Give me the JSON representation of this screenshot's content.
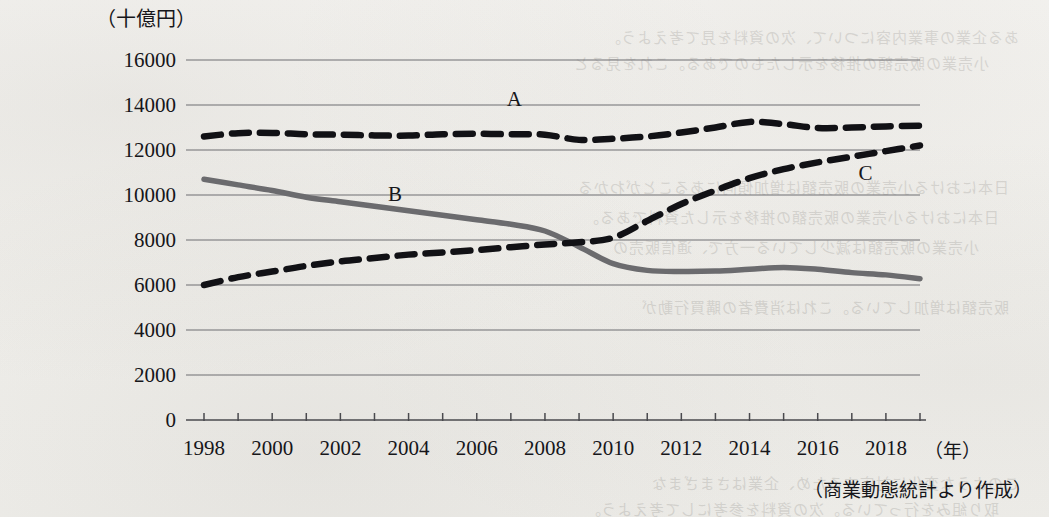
{
  "chart_data": {
    "type": "line",
    "title": "",
    "ylabel": "（十億円）",
    "xlabel": "（年）",
    "source_note": "（商業動態統計より作成）",
    "grid": true,
    "legend_position": "inline-labels",
    "ylim": [
      0,
      16000
    ],
    "ytick_step": 2000,
    "ytick_labels": [
      "16000",
      "14000",
      "12000",
      "10000",
      "8000",
      "6000",
      "4000",
      "2000",
      "0"
    ],
    "ytick_values": [
      16000,
      14000,
      12000,
      10000,
      8000,
      6000,
      4000,
      2000,
      0
    ],
    "xlim": [
      1998,
      2019
    ],
    "xtick_labels": [
      "1998",
      "2000",
      "2002",
      "2004",
      "2006",
      "2008",
      "2010",
      "2012",
      "2014",
      "2016",
      "2018"
    ],
    "xtick_values": [
      1998,
      2000,
      2002,
      2004,
      2006,
      2008,
      2010,
      2012,
      2014,
      2016,
      2018
    ],
    "x": [
      1998,
      1999,
      2000,
      2001,
      2002,
      2003,
      2004,
      2005,
      2006,
      2007,
      2008,
      2009,
      2010,
      2011,
      2012,
      2013,
      2014,
      2015,
      2016,
      2017,
      2018,
      2019
    ],
    "series": [
      {
        "name": "A",
        "label": "A",
        "style": "dashed",
        "color": "#111115",
        "label_x": 2007.1,
        "label_y": 13950,
        "values": [
          12600,
          12750,
          12760,
          12700,
          12680,
          12650,
          12640,
          12700,
          12720,
          12700,
          12680,
          12450,
          12500,
          12600,
          12780,
          13000,
          13250,
          13150,
          12980,
          13000,
          13050,
          13080
        ]
      },
      {
        "name": "B",
        "label": "B",
        "style": "solid",
        "color": "#6b6b6e",
        "label_x": 2003.6,
        "label_y": 9750,
        "values": [
          10700,
          10450,
          10200,
          9900,
          9700,
          9500,
          9300,
          9100,
          8900,
          8700,
          8400,
          7700,
          6950,
          6650,
          6600,
          6620,
          6700,
          6780,
          6700,
          6550,
          6450,
          6280
        ]
      },
      {
        "name": "C",
        "label": "C",
        "style": "dashed",
        "color": "#111115",
        "label_x": 2017.4,
        "label_y": 10650,
        "values": [
          6000,
          6350,
          6600,
          6850,
          7050,
          7200,
          7350,
          7450,
          7550,
          7680,
          7800,
          7900,
          8100,
          8850,
          9600,
          10200,
          10750,
          11150,
          11450,
          11700,
          11950,
          12200
        ]
      }
    ]
  }
}
